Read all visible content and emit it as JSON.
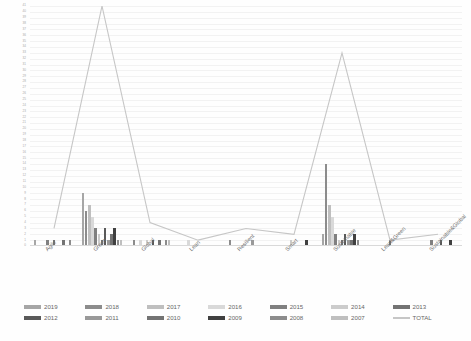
{
  "chart_data": {
    "type": "bar",
    "title": "",
    "subtitle": "",
    "xlabel": "",
    "ylabel": "",
    "ylim": [
      0,
      41
    ],
    "grid": true,
    "legend_position": "bottom",
    "categories": [
      "Agile",
      "Green",
      "Global",
      "Lean",
      "Resilient",
      "Smart",
      "Sustainable",
      "Lean&Green",
      "Sustainable&Global"
    ],
    "y_ticks": [
      "41",
      "40",
      "39",
      "38",
      "37",
      "36",
      "35",
      "34",
      "33",
      "32",
      "31",
      "30",
      "29",
      "28",
      "27",
      "26",
      "25",
      "24",
      "23",
      "22",
      "21",
      "20",
      "19",
      "18",
      "17",
      "16",
      "15",
      "14",
      "13",
      "12",
      "11",
      "10",
      "9",
      "8",
      "7",
      "6",
      "5",
      "4",
      "3",
      "2",
      "1",
      "0"
    ],
    "series": [
      {
        "name": "2019",
        "color": "#a6a6a6",
        "values": [
          1,
          9,
          0,
          0,
          0,
          0,
          2,
          0,
          0
        ]
      },
      {
        "name": "2018",
        "color": "#8c8c8c",
        "values": [
          0,
          6,
          1,
          0,
          1,
          0,
          14,
          0,
          0
        ]
      },
      {
        "name": "2017",
        "color": "#bfbfbf",
        "values": [
          0,
          7,
          0,
          0,
          0,
          0,
          7,
          0,
          0
        ]
      },
      {
        "name": "2016",
        "color": "#d9d9d9",
        "values": [
          0,
          5,
          1,
          1,
          0,
          0,
          5,
          0,
          0
        ]
      },
      {
        "name": "2015",
        "color": "#808080",
        "values": [
          1,
          3,
          0,
          0,
          0,
          0,
          2,
          0,
          1
        ]
      },
      {
        "name": "2014",
        "color": "#cccccc",
        "values": [
          0,
          2,
          1,
          0,
          0,
          1,
          1,
          0,
          0
        ]
      },
      {
        "name": "2013",
        "color": "#737373",
        "values": [
          1,
          1,
          0,
          0,
          0,
          0,
          1,
          1,
          0
        ]
      },
      {
        "name": "2012",
        "color": "#595959",
        "values": [
          0,
          3,
          1,
          0,
          0,
          0,
          2,
          0,
          1
        ]
      },
      {
        "name": "2011",
        "color": "#999999",
        "values": [
          0,
          1,
          0,
          0,
          1,
          0,
          1,
          0,
          0
        ]
      },
      {
        "name": "2010",
        "color": "#737373",
        "values": [
          1,
          2,
          1,
          0,
          0,
          0,
          1,
          0,
          0
        ]
      },
      {
        "name": "2009",
        "color": "#404040",
        "values": [
          0,
          3,
          0,
          0,
          0,
          1,
          2,
          0,
          1
        ]
      },
      {
        "name": "2008",
        "color": "#8c8c8c",
        "values": [
          1,
          1,
          1,
          0,
          0,
          0,
          1,
          0,
          0
        ]
      },
      {
        "name": "2007",
        "color": "#bfbfbf",
        "values": [
          0,
          1,
          1,
          0,
          0,
          0,
          0,
          0,
          0
        ]
      }
    ],
    "line_series": {
      "name": "TOTAL",
      "color": "#c6c6c6",
      "values": [
        3,
        41,
        4,
        1,
        3,
        2,
        33,
        1,
        2
      ]
    }
  },
  "legend": {
    "rows": [
      [
        {
          "label": "2019",
          "color": "#a6a6a6",
          "type": "bar"
        },
        {
          "label": "2018",
          "color": "#8c8c8c",
          "type": "bar"
        },
        {
          "label": "2017",
          "color": "#bfbfbf",
          "type": "bar"
        },
        {
          "label": "2016",
          "color": "#d9d9d9",
          "type": "bar"
        },
        {
          "label": "2015",
          "color": "#808080",
          "type": "bar"
        },
        {
          "label": "2014",
          "color": "#cccccc",
          "type": "bar"
        },
        {
          "label": "2013",
          "color": "#737373",
          "type": "bar"
        }
      ],
      [
        {
          "label": "2012",
          "color": "#595959",
          "type": "bar"
        },
        {
          "label": "2011",
          "color": "#999999",
          "type": "bar"
        },
        {
          "label": "2010",
          "color": "#737373",
          "type": "bar"
        },
        {
          "label": "2009",
          "color": "#404040",
          "type": "bar"
        },
        {
          "label": "2008",
          "color": "#8c8c8c",
          "type": "bar"
        },
        {
          "label": "2007",
          "color": "#bfbfbf",
          "type": "bar"
        },
        {
          "label": "TOTAL",
          "color": "#c6c6c6",
          "type": "line"
        }
      ]
    ]
  }
}
